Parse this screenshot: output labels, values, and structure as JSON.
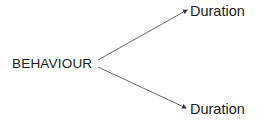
{
  "diagram": {
    "root": {
      "label": "BEHAVIOUR"
    },
    "branches": [
      {
        "label": "Duration",
        "position": "upper"
      },
      {
        "label": "Duration",
        "position": "lower"
      }
    ],
    "colors": {
      "text": "#1a1a1a",
      "line": "#555555",
      "background": "#ffffff"
    }
  }
}
